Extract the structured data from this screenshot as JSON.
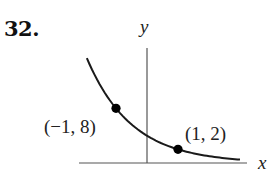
{
  "problem": {
    "number": "32."
  },
  "axes": {
    "x_label": "x",
    "y_label": "y"
  },
  "points": [
    {
      "x": -1,
      "y": 8,
      "label": "(−1, 8)"
    },
    {
      "x": 1,
      "y": 2,
      "label": "(1, 2)"
    }
  ],
  "chart_data": {
    "type": "line",
    "title": "",
    "xlabel": "x",
    "ylabel": "y",
    "function": "y = 4 * (1/2)^x",
    "series": [
      {
        "name": "exponential decay curve",
        "x": [
          -1.94,
          -1.5,
          -1,
          -0.5,
          0,
          0.5,
          1,
          1.5,
          2,
          2.5,
          3
        ],
        "values": [
          15.3,
          11.3,
          8,
          5.66,
          4,
          2.83,
          2,
          1.41,
          1,
          0.71,
          0.5
        ]
      }
    ],
    "labeled_points": [
      {
        "x": -1,
        "y": 8,
        "label": "(−1, 8)"
      },
      {
        "x": 1,
        "y": 2,
        "label": "(1, 2)"
      }
    ],
    "grid": false,
    "ticks": false,
    "xlim": [
      -2.2,
      3.2
    ],
    "ylim": [
      0,
      17
    ]
  }
}
